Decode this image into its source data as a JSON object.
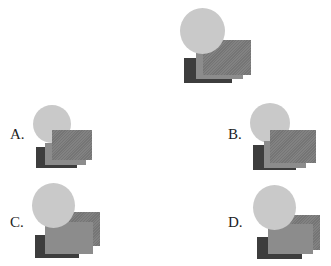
{
  "colors": {
    "circle": "#c9c9c9",
    "rect_top": "#7b7b7b",
    "rect_middle": "#8c8c8c",
    "rect_dark": "#3d3d3d"
  },
  "reference": {
    "circle": {
      "x": 180,
      "y": 8,
      "w": 45,
      "h": 46,
      "z": 4
    },
    "rect_top": {
      "x": 203,
      "y": 40,
      "w": 48,
      "h": 35,
      "z": 3
    },
    "rect_middle": {
      "x": 196,
      "y": 52,
      "w": 47,
      "h": 27,
      "z": 2
    },
    "rect_dark": {
      "x": 184,
      "y": 58,
      "w": 48,
      "h": 25,
      "z": 1
    }
  },
  "options": [
    {
      "label": "A.",
      "label_pos": {
        "x": 10,
        "y": 127
      },
      "circle": {
        "x": 33,
        "y": 105,
        "w": 38,
        "h": 38,
        "z": 1
      },
      "rect_top": {
        "x": 52,
        "y": 130,
        "w": 40,
        "h": 30,
        "z": 4
      },
      "rect_middle": {
        "x": 45,
        "y": 143,
        "w": 41,
        "h": 22,
        "z": 3
      },
      "rect_dark": {
        "x": 36,
        "y": 147,
        "w": 41,
        "h": 21,
        "z": 2
      }
    },
    {
      "label": "B.",
      "label_pos": {
        "x": 228,
        "y": 127
      },
      "circle": {
        "x": 250,
        "y": 103,
        "w": 40,
        "h": 40,
        "z": 1
      },
      "rect_top": {
        "x": 270,
        "y": 130,
        "w": 46,
        "h": 33,
        "z": 4
      },
      "rect_middle": {
        "x": 264,
        "y": 141,
        "w": 42,
        "h": 27,
        "z": 3
      },
      "rect_dark": {
        "x": 253,
        "y": 145,
        "w": 43,
        "h": 25,
        "z": 2
      }
    },
    {
      "label": "C.",
      "label_pos": {
        "x": 10,
        "y": 215
      },
      "circle": {
        "x": 32,
        "y": 183,
        "w": 43,
        "h": 45,
        "z": 4
      },
      "rect_top": {
        "x": 54,
        "y": 212,
        "w": 46,
        "h": 34,
        "z": 1
      },
      "rect_middle": {
        "x": 45,
        "y": 222,
        "w": 48,
        "h": 32,
        "z": 3
      },
      "rect_dark": {
        "x": 35,
        "y": 235,
        "w": 44,
        "h": 23,
        "z": 2
      }
    },
    {
      "label": "D.",
      "label_pos": {
        "x": 228,
        "y": 215
      },
      "circle": {
        "x": 253,
        "y": 185,
        "w": 43,
        "h": 45,
        "z": 4
      },
      "rect_top": {
        "x": 276,
        "y": 215,
        "w": 44,
        "h": 35,
        "z": 2
      },
      "rect_middle": {
        "x": 268,
        "y": 224,
        "w": 45,
        "h": 30,
        "z": 3
      },
      "rect_dark": {
        "x": 257,
        "y": 237,
        "w": 45,
        "h": 22,
        "z": 1
      }
    }
  ]
}
